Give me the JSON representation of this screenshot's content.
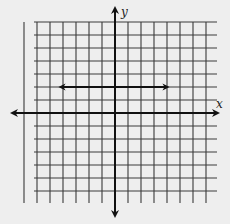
{
  "diagram": {
    "type": "coordinate-grid",
    "x_axis_label": "x",
    "y_axis_label": "y",
    "grid": {
      "x_min": -7,
      "x_max": 7,
      "y_min": -6,
      "y_max": 7,
      "unit_px": 13,
      "origin_px": [
        115,
        113
      ]
    },
    "figures": [
      {
        "type": "line",
        "description": "horizontal line y = 2 drawn with arrows at both ends",
        "from": [
          -4,
          2
        ],
        "to": [
          4,
          2
        ],
        "arrows": "both"
      }
    ],
    "colors": {
      "background": "#eeeeee",
      "grid": "#3a3a3a",
      "axis": "#111111"
    }
  }
}
